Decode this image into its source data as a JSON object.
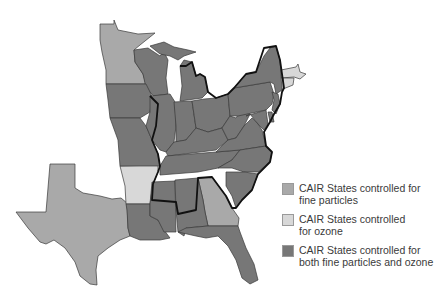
{
  "colors": {
    "fine_particles": "#a9a9a9",
    "ozone": "#d8d8d8",
    "both": "#777777",
    "non_cair": "#ffffff",
    "border": "#3a3a3a"
  },
  "legend": {
    "items": [
      {
        "key": "fine_particles",
        "label": "CAIR States controlled for\nfine particles"
      },
      {
        "key": "ozone",
        "label": "CAIR States controlled\nfor ozone"
      },
      {
        "key": "both",
        "label": "CAIR States controlled for\nboth fine particles and ozone"
      }
    ]
  },
  "map": {
    "states": {
      "fine_particles": [
        "Minnesota",
        "Texas",
        "Georgia"
      ],
      "ozone": [
        "Arkansas",
        "Massachusetts",
        "Connecticut"
      ],
      "both": [
        "Wisconsin",
        "Michigan",
        "Iowa",
        "Missouri",
        "Illinois",
        "Indiana",
        "Ohio",
        "Kentucky",
        "Tennessee",
        "West Virginia",
        "Virginia",
        "North Carolina",
        "South Carolina",
        "Pennsylvania",
        "New York",
        "New Jersey",
        "Delaware",
        "Maryland",
        "Louisiana",
        "Mississippi",
        "Alabama",
        "Florida"
      ]
    }
  }
}
